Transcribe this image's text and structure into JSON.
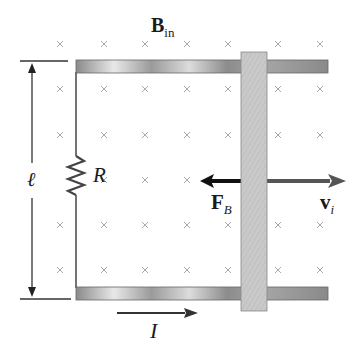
{
  "diagram": {
    "field_label": {
      "main": "B",
      "sub": "in"
    },
    "length_label": "ℓ",
    "resistor_label": "R",
    "force_label": {
      "main": "F",
      "sub": "B"
    },
    "velocity_label": {
      "main": "v",
      "sub": "i"
    },
    "current_label": "I",
    "field_symbol": "×",
    "colors": {
      "field_marks": "#a0a0a0",
      "rail": "#9a9a9a",
      "bar": "#c8c8c8",
      "force_arrow": "#111111",
      "velocity_arrow": "#555555",
      "wire": "#444444"
    }
  }
}
